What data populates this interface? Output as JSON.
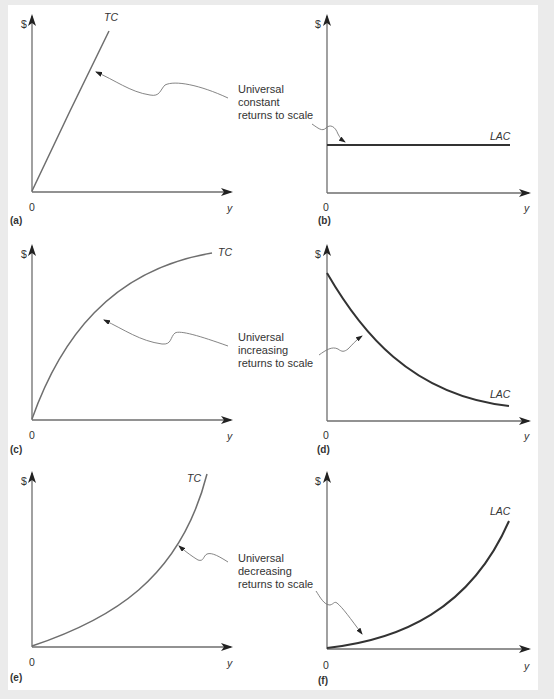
{
  "figure": {
    "background_color": "#ebebeb",
    "panel_color": "#ffffff",
    "axis_color": "#6e6e6e",
    "lac_curve_color": "#333333"
  },
  "panels": [
    {
      "id": "a",
      "caption": "(a)",
      "y_axis_label": "$",
      "x_axis_label": "y",
      "origin_label": "0",
      "curve_label": "TC",
      "curve_shape": "straight line from origin"
    },
    {
      "id": "b",
      "caption": "(b)",
      "y_axis_label": "$",
      "x_axis_label": "y",
      "origin_label": "0",
      "curve_label": "LAC",
      "curve_shape": "horizontal line"
    },
    {
      "id": "c",
      "caption": "(c)",
      "y_axis_label": "$",
      "x_axis_label": "y",
      "origin_label": "0",
      "curve_label": "TC",
      "curve_shape": "concave increasing"
    },
    {
      "id": "d",
      "caption": "(d)",
      "y_axis_label": "$",
      "x_axis_label": "y",
      "origin_label": "0",
      "curve_label": "LAC",
      "curve_shape": "convex decreasing"
    },
    {
      "id": "e",
      "caption": "(e)",
      "y_axis_label": "$",
      "x_axis_label": "y",
      "origin_label": "0",
      "curve_label": "TC",
      "curve_shape": "convex increasing"
    },
    {
      "id": "f",
      "caption": "(f)",
      "y_axis_label": "$",
      "x_axis_label": "y",
      "origin_label": "0",
      "curve_label": "LAC",
      "curve_shape": "convex increasing from near zero"
    }
  ],
  "annotations": [
    {
      "rows": "a-b",
      "text": "Universal\nconstant\nreturns to scale"
    },
    {
      "rows": "c-d",
      "text": "Universal\nincreasing\nreturns to scale"
    },
    {
      "rows": "e-f",
      "text": "Universal\ndecreasing\nreturns to scale"
    }
  ]
}
